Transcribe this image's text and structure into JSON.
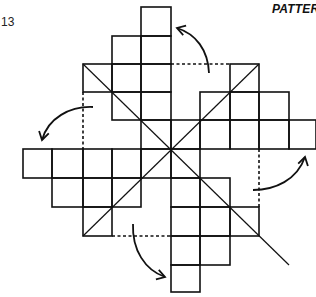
{
  "figure": {
    "number": "13",
    "title": "PATTER"
  },
  "colors": {
    "ink": "#111111",
    "background": "#ffffff"
  },
  "grid": {
    "x_lines": [
      23,
      52,
      83,
      112,
      141,
      171,
      200,
      230,
      259,
      289,
      316
    ],
    "y_lines": [
      7,
      36,
      64,
      92,
      120,
      149,
      178,
      207,
      236,
      265,
      292
    ],
    "rows": [
      {
        "row": 0,
        "cols": [
          4
        ]
      },
      {
        "row": 1,
        "cols": [
          3,
          4
        ]
      },
      {
        "row": 2,
        "cols": [
          2,
          3,
          4,
          7
        ]
      },
      {
        "row": 3,
        "cols": [
          3,
          4,
          6,
          7,
          8
        ]
      },
      {
        "row": 4,
        "cols": [
          4,
          5,
          6,
          7,
          8,
          9
        ]
      },
      {
        "row": 5,
        "cols": [
          0,
          1,
          2,
          3,
          4,
          5
        ]
      },
      {
        "row": 6,
        "cols": [
          1,
          2,
          3,
          5,
          6
        ]
      },
      {
        "row": 7,
        "cols": [
          2,
          5,
          6,
          7
        ]
      },
      {
        "row": 8,
        "cols": [
          5,
          6
        ]
      },
      {
        "row": 9,
        "cols": [
          5
        ]
      }
    ],
    "diagonals": [
      {
        "from": [
          83,
          64
        ],
        "to": [
          289,
          265
        ]
      },
      {
        "from": [
          83,
          236
        ],
        "to": [
          259,
          64
        ]
      }
    ],
    "fold_lines": [
      {
        "name": "top-fold-line",
        "from": [
          171,
          64
        ],
        "to": [
          230,
          64
        ]
      },
      {
        "name": "left-fold-line",
        "from": [
          83,
          92
        ],
        "to": [
          83,
          149
        ]
      },
      {
        "name": "right-fold-line",
        "from": [
          259,
          149
        ],
        "to": [
          259,
          207
        ]
      },
      {
        "name": "bottom-fold-line",
        "from": [
          112,
          236
        ],
        "to": [
          171,
          236
        ]
      }
    ]
  },
  "arrows": [
    {
      "name": "top-fold-arrow",
      "path": "M209,73 C208,50 196,34 177,28",
      "head": [
        177,
        28
      ],
      "head_dir": [
        -1,
        -0.3
      ]
    },
    {
      "name": "left-fold-arrow",
      "path": "M93,107 C70,106 48,118 42,140",
      "head": [
        42,
        140
      ],
      "head_dir": [
        -0.25,
        1
      ]
    },
    {
      "name": "right-fold-arrow",
      "path": "M253,190 C275,190 297,180 305,157",
      "head": [
        305,
        157
      ],
      "head_dir": [
        0.25,
        -1
      ]
    },
    {
      "name": "bottom-fold-arrow",
      "path": "M133,224 C132,250 145,270 165,277",
      "head": [
        165,
        277
      ],
      "head_dir": [
        1,
        0.3
      ]
    }
  ]
}
